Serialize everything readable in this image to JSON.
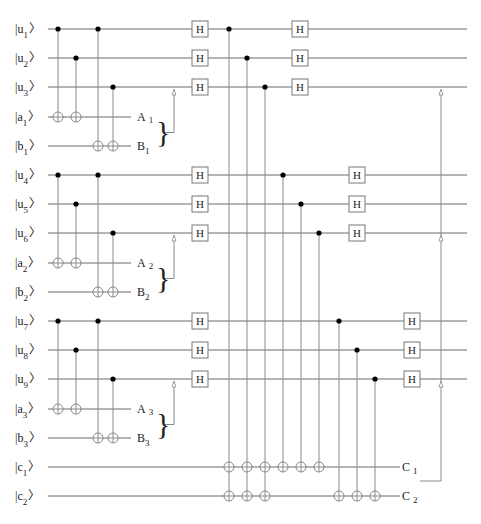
{
  "diagram": {
    "type": "quantum-circuit",
    "wire_color": "#6b6b6b",
    "gate_label": "H",
    "qubits": [
      {
        "id": "u1",
        "letter": "u",
        "index": "1",
        "y": 29
      },
      {
        "id": "u2",
        "letter": "u",
        "index": "2",
        "y": 58
      },
      {
        "id": "u3",
        "letter": "u",
        "index": "3",
        "y": 87
      },
      {
        "id": "a1",
        "letter": "a",
        "index": "1",
        "y": 117,
        "output": {
          "letter": "A",
          "index": "1"
        }
      },
      {
        "id": "b1",
        "letter": "b",
        "index": "1",
        "y": 146,
        "output": {
          "letter": "B",
          "index": "1"
        }
      },
      {
        "id": "u4",
        "letter": "u",
        "index": "4",
        "y": 175
      },
      {
        "id": "u5",
        "letter": "u",
        "index": "5",
        "y": 204
      },
      {
        "id": "u6",
        "letter": "u",
        "index": "6",
        "y": 233
      },
      {
        "id": "a2",
        "letter": "a",
        "index": "2",
        "y": 263,
        "output": {
          "letter": "A",
          "index": "2"
        }
      },
      {
        "id": "b2",
        "letter": "b",
        "index": "2",
        "y": 292,
        "output": {
          "letter": "B",
          "index": "2"
        }
      },
      {
        "id": "u7",
        "letter": "u",
        "index": "7",
        "y": 321
      },
      {
        "id": "u8",
        "letter": "u",
        "index": "8",
        "y": 350
      },
      {
        "id": "u9",
        "letter": "u",
        "index": "9",
        "y": 379
      },
      {
        "id": "a3",
        "letter": "a",
        "index": "3",
        "y": 409,
        "output": {
          "letter": "A",
          "index": "3"
        }
      },
      {
        "id": "b3",
        "letter": "b",
        "index": "3",
        "y": 438,
        "output": {
          "letter": "B",
          "index": "3"
        }
      },
      {
        "id": "c1",
        "letter": "c",
        "index": "1",
        "y": 467,
        "output": {
          "letter": "C",
          "index": "1"
        }
      },
      {
        "id": "c2",
        "letter": "c",
        "index": "2",
        "y": 496,
        "output": {
          "letter": "C",
          "index": "2"
        }
      }
    ],
    "blocks": [
      {
        "u": [
          "u1",
          "u2",
          "u3"
        ],
        "a": "a1",
        "b": "b1",
        "classical_feedback_to": "u3"
      },
      {
        "u": [
          "u4",
          "u5",
          "u6"
        ],
        "a": "a2",
        "b": "b2",
        "classical_feedback_to": "u6"
      },
      {
        "u": [
          "u7",
          "u8",
          "u9"
        ],
        "a": "a3",
        "b": "b3",
        "classical_feedback_to": "u9"
      }
    ],
    "first_hadamard_layer": [
      "u1",
      "u2",
      "u3",
      "u4",
      "u5",
      "u6",
      "u7",
      "u8",
      "u9"
    ],
    "second_hadamard_layer": [
      {
        "qubits": [
          "u1",
          "u2",
          "u3"
        ],
        "x": 300
      },
      {
        "qubits": [
          "u4",
          "u5",
          "u6"
        ],
        "x": 357
      },
      {
        "qubits": [
          "u7",
          "u8",
          "u9"
        ],
        "x": 412
      }
    ],
    "parity_cnots": [
      {
        "control": "u1",
        "targets": [
          "c1",
          "c2"
        ],
        "x": 229
      },
      {
        "control": "u2",
        "targets": [
          "c1",
          "c2"
        ],
        "x": 247
      },
      {
        "control": "u3",
        "targets": [
          "c1",
          "c2"
        ],
        "x": 265
      },
      {
        "control": "u4",
        "targets": [
          "c1"
        ],
        "x": 283
      },
      {
        "control": "u5",
        "targets": [
          "c1"
        ],
        "x": 301
      },
      {
        "control": "u6",
        "targets": [
          "c1"
        ],
        "x": 319
      },
      {
        "control": "u7",
        "targets": [
          "c2"
        ],
        "x": 339
      },
      {
        "control": "u8",
        "targets": [
          "c2"
        ],
        "x": 357
      },
      {
        "control": "u9",
        "targets": [
          "c2"
        ],
        "x": 375
      }
    ],
    "final_feedback": {
      "from": "C1/C2",
      "to": [
        "u3",
        "u6",
        "u9"
      ],
      "x": 441
    }
  }
}
